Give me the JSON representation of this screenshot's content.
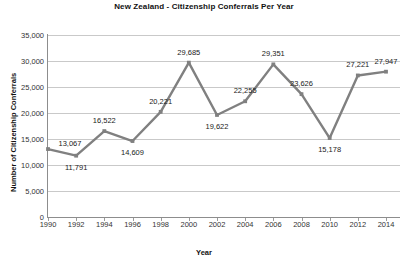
{
  "chart_data": {
    "type": "line",
    "title": "New Zealand - Citizenship Conferrals Per Year",
    "xlabel": "Year",
    "ylabel": "Number of Citizenship Conferrals",
    "grid": true,
    "legend": "none",
    "xlim": [
      1990,
      2014
    ],
    "ylim": [
      0,
      35000
    ],
    "ytick_labels": [
      "35,000",
      "30,000",
      "25,000",
      "20,000",
      "15,000",
      "10,000",
      "5,000",
      "0"
    ],
    "ytick_values": [
      35000,
      30000,
      25000,
      20000,
      15000,
      10000,
      5000,
      0
    ],
    "xtick_labels": [
      "1990",
      "1992",
      "1994",
      "1996",
      "1998",
      "2000",
      "2002",
      "2004",
      "2006",
      "2008",
      "2010",
      "2012",
      "2014"
    ],
    "categories": [
      1990,
      1992,
      1994,
      1996,
      1998,
      2000,
      2002,
      2004,
      2006,
      2008,
      2010,
      2012,
      2014
    ],
    "values": [
      13067,
      11791,
      16522,
      14609,
      20221,
      29685,
      19622,
      22255,
      29351,
      23626,
      15178,
      27221,
      27947
    ],
    "point_labels": [
      "13,067",
      "11,791",
      "16,522",
      "14,609",
      "20,221",
      "29,685",
      "19,622",
      "22,255",
      "29,351",
      "23,626",
      "15,178",
      "27,221",
      "27,947"
    ],
    "label_positions": [
      "right",
      "below",
      "above",
      "below",
      "above",
      "above",
      "below",
      "above",
      "above",
      "above",
      "below",
      "above",
      "above"
    ],
    "series_color": "#808080",
    "marker": "square",
    "grid_color": "#c9c9c9"
  }
}
